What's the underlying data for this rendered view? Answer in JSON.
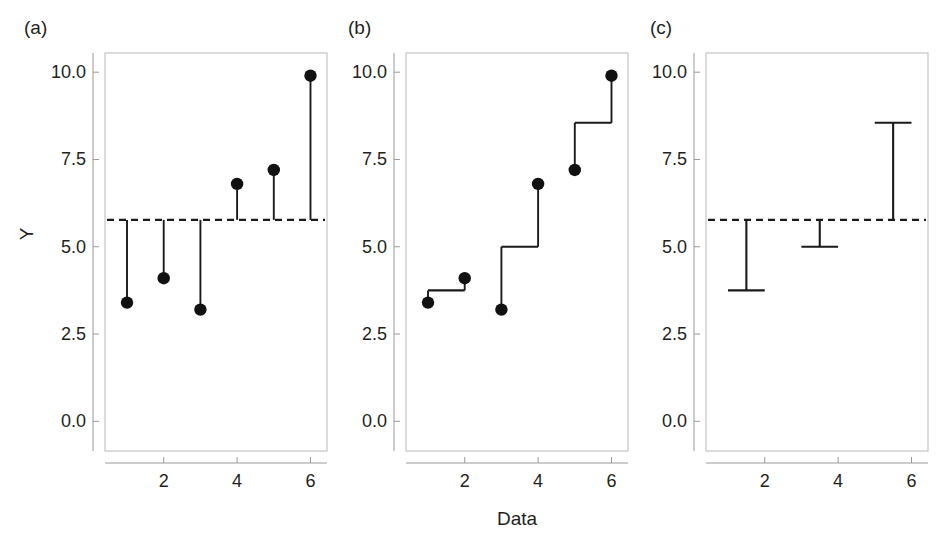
{
  "figure": {
    "width": 945,
    "height": 534,
    "background": "#ffffff",
    "ink_color": "#1a1a1a",
    "axis_color": "#9a9a9a",
    "xlabel": "Data",
    "ylabel": "Y"
  },
  "chart_data": [
    {
      "type": "scatter",
      "panel": "(a)",
      "title": "",
      "xlabel": "",
      "ylabel": "Y",
      "x": [
        1,
        2,
        3,
        4,
        5,
        6
      ],
      "values": [
        3.4,
        4.1,
        3.2,
        6.8,
        7.2,
        9.9
      ],
      "grand_mean": 5.77,
      "reference_line": {
        "label": "grand mean",
        "value": 5.77,
        "style": "dashed"
      },
      "stems": [
        {
          "x": 1,
          "from": 5.77,
          "to": 3.4
        },
        {
          "x": 2,
          "from": 5.77,
          "to": 4.1
        },
        {
          "x": 3,
          "from": 5.77,
          "to": 3.2
        },
        {
          "x": 4,
          "from": 5.77,
          "to": 6.8
        },
        {
          "x": 5,
          "from": 5.77,
          "to": 7.2
        },
        {
          "x": 6,
          "from": 5.77,
          "to": 9.9
        }
      ],
      "xlim": [
        0.4,
        6.45
      ],
      "ylim": [
        -0.85,
        10.55
      ],
      "xticks": [
        2,
        4,
        6
      ],
      "xticklabels": [
        "2",
        "4",
        "6"
      ],
      "yticks": [
        0.0,
        2.5,
        5.0,
        7.5,
        10.0
      ],
      "yticklabels": [
        "0.0",
        "2.5",
        "5.0",
        "7.5",
        "10.0"
      ],
      "grid": false,
      "legend": "none"
    },
    {
      "type": "scatter",
      "panel": "(b)",
      "title": "",
      "xlabel": "Data",
      "ylabel": "",
      "x": [
        1,
        2,
        3,
        4,
        5,
        6
      ],
      "values": [
        3.4,
        4.1,
        3.2,
        6.8,
        7.2,
        9.9
      ],
      "group_means": [
        {
          "group": 1,
          "members": [
            1,
            2
          ],
          "mean": 3.75
        },
        {
          "group": 2,
          "members": [
            3,
            4
          ],
          "mean": 5.0
        },
        {
          "group": 3,
          "members": [
            5,
            6
          ],
          "mean": 8.55
        }
      ],
      "stems": [
        {
          "x": 1,
          "from": 3.75,
          "to": 3.4
        },
        {
          "x": 2,
          "from": 3.75,
          "to": 4.1
        },
        {
          "x": 3,
          "from": 5.0,
          "to": 3.2
        },
        {
          "x": 4,
          "from": 5.0,
          "to": 6.8
        },
        {
          "x": 5,
          "from": 8.55,
          "to": 7.2
        },
        {
          "x": 6,
          "from": 8.55,
          "to": 9.9
        }
      ],
      "connectors": [
        {
          "x_from": 1,
          "x_to": 2,
          "y": 3.75
        },
        {
          "x_from": 3,
          "x_to": 4,
          "y": 5.0
        },
        {
          "x_from": 5,
          "x_to": 6,
          "y": 8.55
        }
      ],
      "xlim": [
        0.4,
        6.45
      ],
      "ylim": [
        -0.85,
        10.55
      ],
      "xticks": [
        2,
        4,
        6
      ],
      "xticklabels": [
        "2",
        "4",
        "6"
      ],
      "yticks": [
        0.0,
        2.5,
        5.0,
        7.5,
        10.0
      ],
      "yticklabels": [
        "0.0",
        "2.5",
        "5.0",
        "7.5",
        "10.0"
      ],
      "grid": false,
      "legend": "none"
    },
    {
      "type": "bar",
      "panel": "(c)",
      "title": "",
      "xlabel": "",
      "ylabel": "",
      "categories": [
        "1-2",
        "3-4",
        "5-6"
      ],
      "x_centers": [
        1.5,
        3.5,
        5.5
      ],
      "values": [
        3.75,
        5.0,
        8.55
      ],
      "grand_mean": 5.77,
      "reference_line": {
        "label": "grand mean",
        "value": 5.77,
        "style": "dashed"
      },
      "brackets": [
        {
          "x_center": 1.5,
          "x_from": 1.0,
          "x_to": 2.0,
          "from": 5.77,
          "to": 3.75
        },
        {
          "x_center": 3.5,
          "x_from": 3.0,
          "x_to": 4.0,
          "from": 5.77,
          "to": 5.0
        },
        {
          "x_center": 5.5,
          "x_from": 5.0,
          "x_to": 6.0,
          "from": 5.77,
          "to": 8.55
        }
      ],
      "xlim": [
        0.4,
        6.45
      ],
      "ylim": [
        -0.85,
        10.55
      ],
      "xticks": [
        2,
        4,
        6
      ],
      "xticklabels": [
        "2",
        "4",
        "6"
      ],
      "yticks": [
        0.0,
        2.5,
        5.0,
        7.5,
        10.0
      ],
      "yticklabels": [
        "0.0",
        "2.5",
        "5.0",
        "7.5",
        "10.0"
      ],
      "grid": false,
      "legend": "none"
    }
  ]
}
